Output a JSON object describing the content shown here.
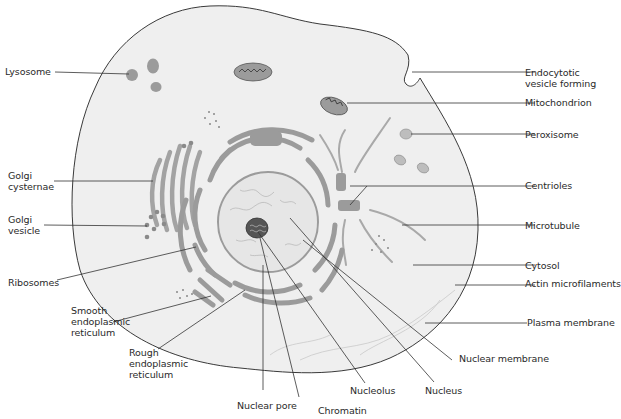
{
  "colors": {
    "cytoplasm": "#efefef",
    "membrane": "#3a3a3a",
    "organelle": "#9b9b9b",
    "organelle_dark": "#7d7d7d",
    "nucleus": "#e6e6e6",
    "leader": "#333333",
    "text": "#2a2a2a"
  },
  "labels": {
    "lysosome": "Lysosome",
    "golgi_cisternae": "Golgi\ncysternae",
    "golgi_vesicle": "Golgi\nvesicle",
    "ribosomes": "Ribosomes",
    "smooth_er": "Smooth\nendoplasmic\nreticulum",
    "rough_er": "Rough\nendoplasmic\nreticulum",
    "nuclear_pore": "Nuclear pore",
    "chromatin": "Chromatin",
    "nucleolus": "Nucleolus",
    "nucleus": "Nucleus",
    "nuclear_membrane": "Nuclear membrane",
    "plasma_membrane": "Plasma membrane",
    "actin_microfilaments": "Actin microfilaments",
    "cytosol": "Cytosol",
    "microtubule": "Microtubule",
    "centrioles": "Centrioles",
    "peroxisome": "Peroxisome",
    "mitochondrion": "Mitochondrion",
    "endocytotic_vesicle": "Endocytotic\nvesicle forming"
  }
}
